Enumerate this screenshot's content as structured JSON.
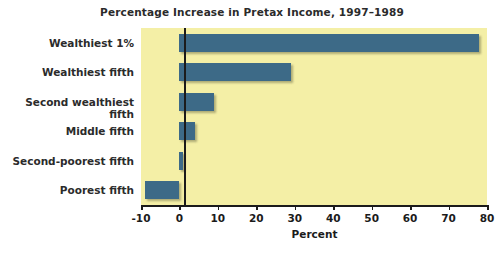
{
  "chart_data": {
    "type": "bar",
    "orientation": "horizontal",
    "title": "Percentage Increase in Pretax Income, 1997–1989",
    "xlabel": "Percent",
    "ylabel": "",
    "categories": [
      "Wealthiest 1%",
      "Wealthiest fifth",
      "Second wealthiest fifth",
      "Middle fifth",
      "Second-poorest fifth",
      "Poorest fifth"
    ],
    "values": [
      78,
      29,
      9,
      4,
      1,
      -9
    ],
    "xlim": [
      -10,
      80
    ],
    "xticks": [
      -10,
      0,
      10,
      20,
      30,
      40,
      50,
      60,
      70,
      80
    ],
    "xtick_labels": [
      "-10",
      "0",
      "10",
      "20",
      "30",
      "40",
      "50",
      "60",
      "70",
      "80"
    ],
    "grid": false,
    "legend": false,
    "colors": {
      "bar": "#3d6a87",
      "plot_background": "#f4efa6",
      "figure_background": "#ffffff",
      "axis": "#1b1b1b",
      "text": "#2b2b2b"
    }
  }
}
